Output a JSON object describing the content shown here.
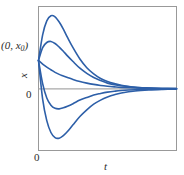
{
  "figure": {
    "background_color": "#ffffff",
    "frame_color": "#999999",
    "curve_color": "#2d5fa8",
    "zero_line_color": "#a8a8a8",
    "text_color": "#2b2b2b"
  },
  "labels": {
    "initial_point_prefix": "(0, ",
    "initial_point_var": "x",
    "initial_point_sub": "0",
    "initial_point_suffix": ")",
    "y_axis": "x",
    "y_zero_tick": "0",
    "x_zero_tick": "0",
    "x_axis": "t"
  },
  "chart_data": {
    "type": "line",
    "title": "",
    "subtitle": "",
    "xlabel": "t",
    "ylabel": "x",
    "grid": false,
    "legend": null,
    "legend_position": "none",
    "xlim": [
      0,
      10
    ],
    "ylim": [
      -1.2,
      1.6
    ],
    "xticks": [
      0
    ],
    "xticklabels": [
      "0"
    ],
    "yticks": [
      0
    ],
    "yticklabels": [
      "0"
    ],
    "annotations": [
      {
        "text": "(0, x0)",
        "x": 0,
        "y": 0.55,
        "note": "common initial condition for all solution curves"
      }
    ],
    "zero_line": {
      "y": 0,
      "color": "#a8a8a8",
      "from_x": 0,
      "to_x": 10
    },
    "common_start_point": {
      "x": 0,
      "y": 0.55
    },
    "series": [
      {
        "name": "curve-1-overshoot-high",
        "color": "#2d5fa8",
        "x": [
          0.0,
          0.3,
          0.6,
          0.9,
          1.2,
          1.5,
          1.8,
          2.1,
          2.5,
          3.0,
          3.5,
          4.0,
          4.5,
          5.0,
          5.5,
          6.0,
          7.0,
          8.0,
          9.0,
          10.0
        ],
        "y": [
          0.55,
          1.05,
          1.32,
          1.42,
          1.4,
          1.3,
          1.16,
          1.0,
          0.8,
          0.58,
          0.41,
          0.29,
          0.2,
          0.14,
          0.1,
          0.07,
          0.03,
          0.015,
          0.007,
          0.003
        ]
      },
      {
        "name": "curve-2-mild-overshoot",
        "color": "#2d5fa8",
        "x": [
          0.0,
          0.3,
          0.6,
          0.9,
          1.2,
          1.5,
          1.8,
          2.1,
          2.5,
          3.0,
          3.5,
          4.0,
          4.5,
          5.0,
          5.5,
          6.0,
          7.0,
          8.0,
          9.0,
          10.0
        ],
        "y": [
          0.55,
          0.8,
          0.9,
          0.92,
          0.88,
          0.81,
          0.73,
          0.64,
          0.53,
          0.4,
          0.3,
          0.22,
          0.16,
          0.11,
          0.08,
          0.06,
          0.03,
          0.013,
          0.006,
          0.003
        ]
      },
      {
        "name": "curve-3-monotone-decay",
        "color": "#2d5fa8",
        "x": [
          0.0,
          0.3,
          0.6,
          0.9,
          1.2,
          1.5,
          1.8,
          2.1,
          2.5,
          3.0,
          3.5,
          4.0,
          4.5,
          5.0,
          5.5,
          6.0,
          7.0,
          8.0,
          9.0,
          10.0
        ],
        "y": [
          0.55,
          0.48,
          0.42,
          0.37,
          0.32,
          0.28,
          0.25,
          0.22,
          0.18,
          0.14,
          0.11,
          0.085,
          0.065,
          0.05,
          0.038,
          0.028,
          0.016,
          0.009,
          0.005,
          0.002
        ]
      },
      {
        "name": "curve-4-mild-undershoot",
        "color": "#2d5fa8",
        "x": [
          0.0,
          0.3,
          0.6,
          0.9,
          1.2,
          1.5,
          1.8,
          2.1,
          2.5,
          3.0,
          3.5,
          4.0,
          4.5,
          5.0,
          5.5,
          6.0,
          7.0,
          8.0,
          9.0,
          10.0
        ],
        "y": [
          0.55,
          0.1,
          -0.18,
          -0.32,
          -0.38,
          -0.39,
          -0.37,
          -0.34,
          -0.29,
          -0.22,
          -0.17,
          -0.12,
          -0.09,
          -0.065,
          -0.047,
          -0.034,
          -0.018,
          -0.009,
          -0.004,
          -0.002
        ]
      },
      {
        "name": "curve-5-deep-undershoot",
        "color": "#2d5fa8",
        "x": [
          0.0,
          0.3,
          0.6,
          0.9,
          1.2,
          1.5,
          1.8,
          2.1,
          2.5,
          3.0,
          3.5,
          4.0,
          4.5,
          5.0,
          5.5,
          6.0,
          7.0,
          8.0,
          9.0,
          10.0
        ],
        "y": [
          0.55,
          -0.2,
          -0.62,
          -0.85,
          -0.95,
          -0.96,
          -0.91,
          -0.83,
          -0.7,
          -0.54,
          -0.41,
          -0.3,
          -0.22,
          -0.16,
          -0.115,
          -0.083,
          -0.043,
          -0.022,
          -0.011,
          -0.005
        ]
      }
    ]
  }
}
